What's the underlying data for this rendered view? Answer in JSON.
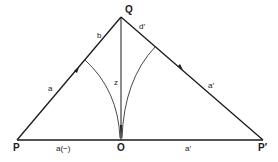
{
  "diagram": {
    "points": {
      "P": "P",
      "Q": "Q",
      "O": "O",
      "P_prime": "P′"
    },
    "edge_labels": {
      "PQ_upper": "b",
      "PQ_lower": "a",
      "QP_prime_upper": "d′",
      "QP_prime_lower": "a′",
      "QO": "z",
      "PO": "a(−)",
      "OP_prime": "a′"
    },
    "colors": {
      "line": "#1a1a1a",
      "background": "#ffffff"
    }
  }
}
